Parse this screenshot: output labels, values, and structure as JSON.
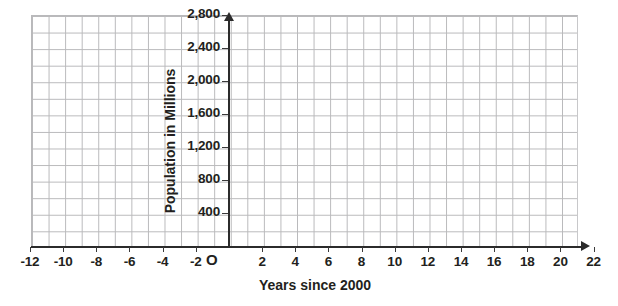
{
  "chart_data": {
    "type": "line",
    "title": "",
    "subtitle": "",
    "xlabel": "Years since 2000",
    "ylabel": "Population in Millions",
    "xlim": [
      -12,
      22
    ],
    "ylim": [
      0,
      2800
    ],
    "xticks": [
      -12,
      -10,
      -8,
      -6,
      -4,
      -2,
      2,
      4,
      6,
      8,
      10,
      12,
      14,
      16,
      18,
      20,
      22
    ],
    "xtick_labels": [
      "-12",
      "-10",
      "-8",
      "-6",
      "-4",
      "-2",
      "2",
      "4",
      "6",
      "8",
      "10",
      "12",
      "14",
      "16",
      "18",
      "20",
      "22"
    ],
    "yticks": [
      400,
      800,
      1200,
      1600,
      2000,
      2400,
      2800
    ],
    "ytick_labels": [
      "400",
      "800",
      "1,200",
      "1,600",
      "2,000",
      "2,400",
      "2,800"
    ],
    "x_minor_step": 1,
    "y_minor_step": 200,
    "grid": true,
    "grid_color": "#b9b9bb",
    "axis_color": "#2b2b2b",
    "text_color": "#231f20",
    "background": "#ffffff",
    "legend": null,
    "series": [],
    "values": [],
    "annotations": [
      {
        "name": "origin-marker",
        "text": "O",
        "x": 0,
        "y": 0
      }
    ]
  },
  "axes": {
    "origin_label": "O",
    "x_title": "Years since 2000",
    "y_title": "Population in Millions"
  }
}
